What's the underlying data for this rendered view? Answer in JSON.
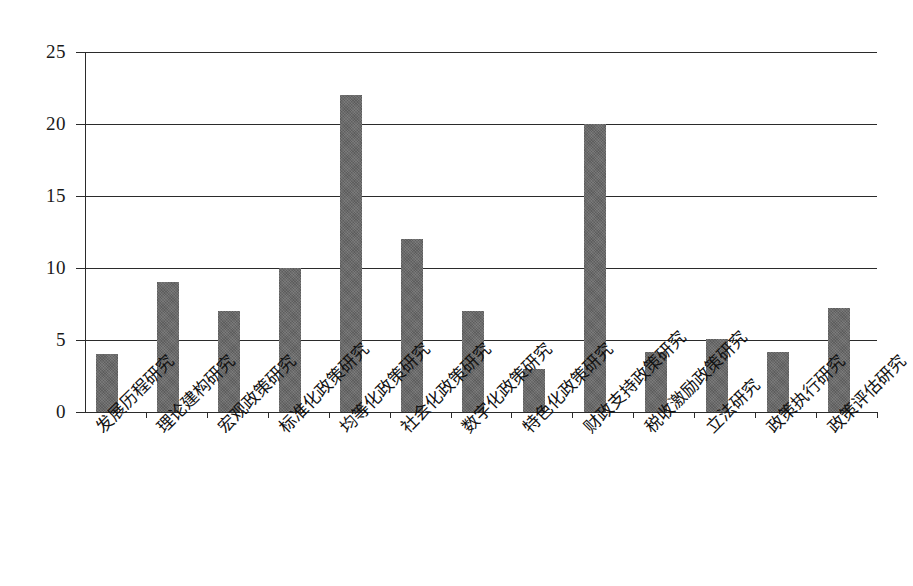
{
  "chart_data": {
    "type": "bar",
    "title": "",
    "subtitle": "",
    "xlabel": "",
    "ylabel": "",
    "ylim": [
      0,
      25
    ],
    "ytick_labels": [
      "0",
      "5",
      "10",
      "15",
      "20",
      "25"
    ],
    "yticks": [
      0,
      5,
      10,
      15,
      20,
      25
    ],
    "grid": true,
    "legend": false,
    "legend_position": "none",
    "orientation": "vertical",
    "bar_color": "#686868",
    "axis_color": "#2b2b2b",
    "background_color": "#ffffff",
    "xtick_rotation": -45,
    "categories": [
      "发展历程研究",
      "理论建构研究",
      "宏观政策研究",
      "标准化政策研究",
      "均等化政策研究",
      "社会化政策研究",
      "数字化政策研究",
      "特色化政策研究",
      "财政支持政策研究",
      "税收激励政策研究",
      "立法研究",
      "政策执行研究",
      "政策评估研究"
    ],
    "values": [
      4,
      9,
      7,
      10,
      22,
      12,
      7,
      3,
      20,
      4.2,
      5.1,
      4.2,
      7.2
    ]
  }
}
